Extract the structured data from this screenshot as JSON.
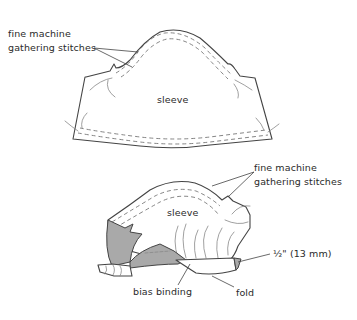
{
  "figure": {
    "top_diagram": {
      "title": "flat sleeve piece",
      "labels": {
        "gathering_line1": "fine machine",
        "gathering_line2": "gathering stitches",
        "sleeve": "sleeve"
      }
    },
    "bottom_diagram": {
      "title": "sleeve with bias binding",
      "labels": {
        "gathering_line1": "fine machine",
        "gathering_line2": "gathering stitches",
        "sleeve": "sleeve",
        "measurement": "½\" (13 mm)",
        "bias_binding": "bias binding",
        "fold": "fold"
      }
    },
    "colors": {
      "line": "#444444",
      "dashed_stitch": "#777777",
      "binding_fill": "#a9a9a9",
      "background": "#ffffff"
    }
  }
}
